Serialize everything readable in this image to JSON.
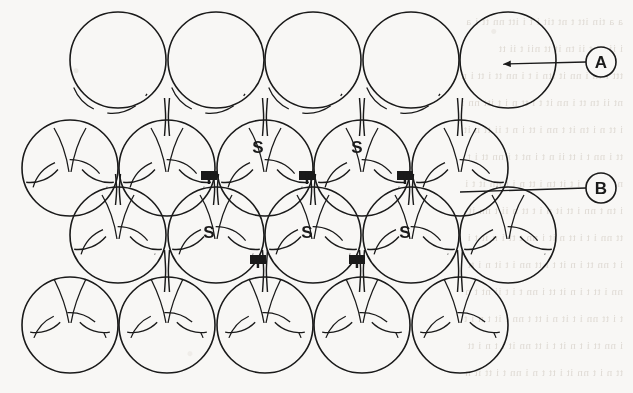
{
  "figure": {
    "background_color": "#f8f7f5",
    "ink_color": "#1a1a1a",
    "stroke_width": 1.6,
    "sphere_radius": 48,
    "callouts": [
      {
        "id": "A",
        "label": "A",
        "name": "callout-a",
        "circle": {
          "cx": 601,
          "cy": 62,
          "r": 15
        },
        "leader": {
          "x1": 586,
          "y1": 62,
          "x2": 503,
          "y2": 64
        },
        "arrow": true
      },
      {
        "id": "B",
        "label": "B",
        "name": "callout-b",
        "circle": {
          "cx": 601,
          "cy": 188,
          "r": 15
        },
        "leader": {
          "x1": 586,
          "y1": 188,
          "x2": 460,
          "y2": 192
        },
        "arrow": false
      }
    ],
    "site_labels": {
      "octahedral_letter": "S",
      "tetrahedral_letter": "T",
      "octahedral": [
        {
          "x": 258,
          "y": 153
        },
        {
          "x": 357,
          "y": 153
        },
        {
          "x": 209,
          "y": 238
        },
        {
          "x": 307,
          "y": 238
        },
        {
          "x": 405,
          "y": 238
        }
      ],
      "tetrahedral": [
        {
          "x": 209,
          "y": 184
        },
        {
          "x": 307,
          "y": 184
        },
        {
          "x": 405,
          "y": 184
        },
        {
          "x": 258,
          "y": 268
        },
        {
          "x": 357,
          "y": 268
        }
      ]
    },
    "rows": [
      {
        "name": "row-1-top-layer",
        "cy": 60,
        "cx": [
          118,
          216,
          313,
          411,
          508
        ]
      },
      {
        "name": "row-2-second-layer",
        "cy": 168,
        "cx": [
          70,
          167,
          265,
          362,
          460
        ]
      },
      {
        "name": "row-3-third-layer",
        "cy": 235,
        "cx": [
          118,
          216,
          313,
          411,
          508
        ]
      },
      {
        "name": "row-4-bottom-layer",
        "cy": 325,
        "cx": [
          70,
          167,
          265,
          362,
          460
        ]
      }
    ]
  },
  "background_text": [
    "a a tin itt t nt tit i t i itt nn tt i a",
    "i  ii  t  nt  ii  tn   it  tt  nii  t  ii  tt",
    "ttt i tn i nn it ttn i t i nn tt i tt i n",
    "nt ii tn tt i nn it t i tt n i t itt nn i",
    "i tt n i tn it t nn i tt i n t ii tt n it",
    "tt i nn t i tt ii n t i nt t i nn tt i t",
    "n i tt nn i t it tn i tt n i t nn it t i",
    "i tn t nn i tt it n i t tt n ii t nn it",
    "tt nn i t i tt n it i nn t tt i n it t i",
    "i t nn tt i n it t i tt nn i t it n i tt",
    "nn i tt t i n it tt i nn t i t ii nt t n",
    "t i tt nn i t it n i tt t nn i it t n i t",
    "i nn tt i t n it t i tt nn it i t n i tt",
    "tt n i t nn it i tt t n i nn t i tt it n"
  ]
}
